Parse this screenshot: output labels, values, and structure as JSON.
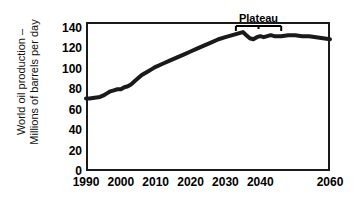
{
  "chart_data": {
    "type": "line",
    "title": "",
    "xlabel": "",
    "ylabel": "World oil production – Millions of barrels per day",
    "ylabel_lines": [
      "World oil production –",
      "Millions of barrels per day"
    ],
    "xlim": [
      1990,
      2060
    ],
    "ylim": [
      0,
      150
    ],
    "grid": false,
    "legend": "none",
    "xticks": [
      1990,
      2000,
      2010,
      2020,
      2030,
      2040,
      2060
    ],
    "xtick_labels": [
      "1990",
      "2000",
      "2010",
      "2020",
      "2030",
      "2040",
      "2060"
    ],
    "yticks": [
      0,
      20,
      40,
      60,
      80,
      100,
      120,
      140
    ],
    "ytick_labels": [
      "0",
      "20",
      "40",
      "60",
      "80",
      "100",
      "120",
      "140"
    ],
    "series": [
      {
        "name": "World oil production",
        "color": "#1a1a1a",
        "line_width": 4,
        "x": [
          1990,
          1991,
          1992,
          1993,
          1994,
          1995,
          1996,
          1997,
          1998,
          1999,
          2000,
          2001,
          2002,
          2003,
          2004,
          2005,
          2006,
          2007,
          2008,
          2009,
          2010,
          2012,
          2014,
          2016,
          2018,
          2020,
          2022,
          2024,
          2026,
          2028,
          2030,
          2031,
          2032,
          2033,
          2034,
          2035,
          2036,
          2037,
          2038,
          2039,
          2040,
          2041,
          2042,
          2043,
          2044,
          2045,
          2046,
          2048,
          2050,
          2052,
          2054,
          2056,
          2058,
          2060
        ],
        "y": [
          71,
          71,
          71.5,
          72,
          72.5,
          74,
          76,
          78,
          79,
          80,
          80,
          82,
          83,
          85,
          88,
          91,
          94,
          96,
          98,
          100,
          102,
          105,
          108,
          111,
          114,
          117,
          120,
          123,
          126,
          129,
          131,
          132,
          133,
          134,
          135,
          136,
          133,
          130,
          129,
          131,
          132,
          131,
          132,
          133,
          132,
          132,
          132,
          133,
          133,
          132,
          132,
          131,
          130,
          129
        ]
      }
    ],
    "annotations": [
      {
        "name": "plateau",
        "label": "Plateau",
        "type": "bracket",
        "x_start": 2033,
        "x_end": 2046,
        "y": 142
      }
    ]
  },
  "axis": {
    "y_title_line1": "World oil production –",
    "y_title_line2": "Millions of barrels per day"
  }
}
